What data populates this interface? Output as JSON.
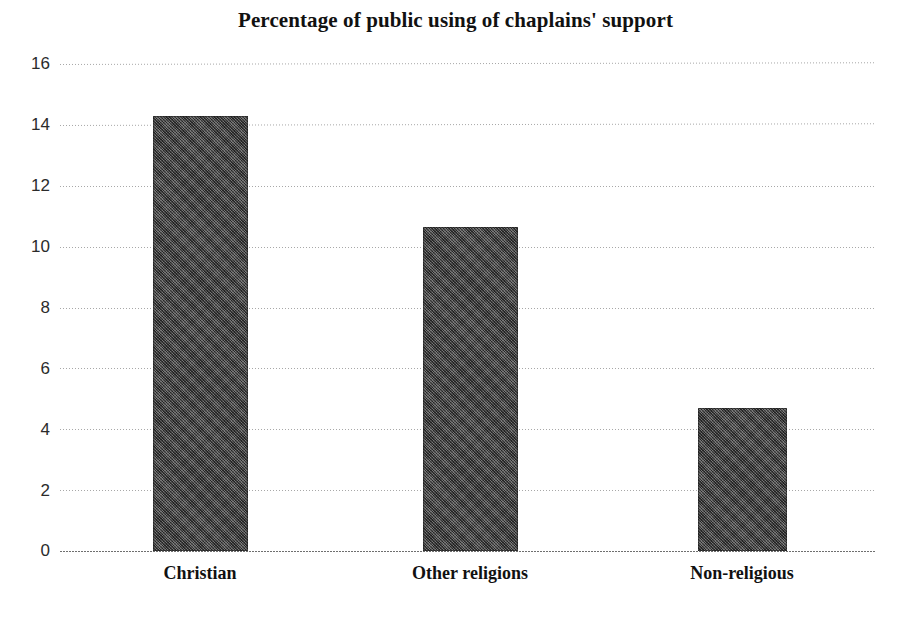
{
  "chart_data": {
    "type": "bar",
    "title": "Percentage of public using of chaplains' support",
    "xlabel": "",
    "ylabel": "",
    "categories": [
      "Christian",
      "Other religions",
      "Non-religious"
    ],
    "values": [
      14.3,
      10.65,
      4.7
    ],
    "ylim": [
      0,
      16
    ],
    "yticks": [
      0,
      2,
      4,
      6,
      8,
      10,
      12,
      14,
      16
    ],
    "ytick_labels": [
      "0",
      "2",
      "4",
      "6",
      "8",
      "10",
      "12",
      "14",
      "16"
    ],
    "grid": true,
    "grid_axis": "y",
    "legend": false,
    "legend_position": "none",
    "bar_color": "#4c4c4c",
    "background_color": "#ffffff",
    "series": [
      {
        "name": "Percentage of public using of chaplains' support",
        "values": [
          14.3,
          10.65,
          4.7
        ]
      }
    ]
  },
  "axis": {
    "y_ticks": [
      {
        "label": "16",
        "value": 16
      },
      {
        "label": "14",
        "value": 14
      },
      {
        "label": "12",
        "value": 12
      },
      {
        "label": "10",
        "value": 10
      },
      {
        "label": "8",
        "value": 8
      },
      {
        "label": "6",
        "value": 6
      },
      {
        "label": "4",
        "value": 4
      },
      {
        "label": "2",
        "value": 2
      },
      {
        "label": "0",
        "value": 0
      }
    ],
    "x_categories": [
      {
        "label": "Christian",
        "value": 14.3
      },
      {
        "label": "Other religions",
        "value": 10.65
      },
      {
        "label": "Non-religious",
        "value": 4.7
      }
    ]
  }
}
